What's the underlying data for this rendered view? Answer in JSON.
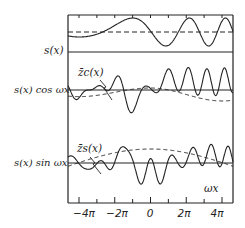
{
  "chart_data": {
    "type": "line",
    "title": "",
    "xlabel": "ωx",
    "x_ticks": [
      "−4π",
      "−2π",
      "0",
      "2π",
      "4π"
    ],
    "x_tick_values": [
      -12.566,
      -6.283,
      0,
      6.283,
      12.566
    ],
    "xlim": [
      -14.5,
      14.5
    ],
    "panels": [
      {
        "label": "s(x)",
        "series": [
          {
            "name": "s(x)",
            "style": "solid",
            "description": "chirp sinusoid with increasing frequency"
          },
          {
            "name": "mean",
            "style": "dashed",
            "description": "horizontal dashed line"
          }
        ]
      },
      {
        "label": "s(x) cos ωx",
        "annotation": "z̄c(x)",
        "series": [
          {
            "name": "s(x) cos ωx",
            "style": "solid"
          },
          {
            "name": "z̄c(x)",
            "style": "dashed",
            "description": "slow envelope, dips near ±3π"
          }
        ]
      },
      {
        "label": "s(x) sin ωx",
        "annotation": "z̄s(x)",
        "series": [
          {
            "name": "s(x) sin ωx",
            "style": "solid"
          },
          {
            "name": "z̄s(x)",
            "style": "dashed",
            "description": "broad hump peaking near 0"
          }
        ]
      }
    ]
  },
  "labels": {
    "panel1": "s(x)",
    "panel2": "s(x) cos ωx",
    "panel3": "s(x) sin ωx",
    "zc": "z̄c(x)",
    "zs": "z̄s(x)",
    "omega_x": "ωx"
  },
  "ticks": [
    "−4π",
    "−2π",
    "0",
    "2π",
    "4π"
  ]
}
